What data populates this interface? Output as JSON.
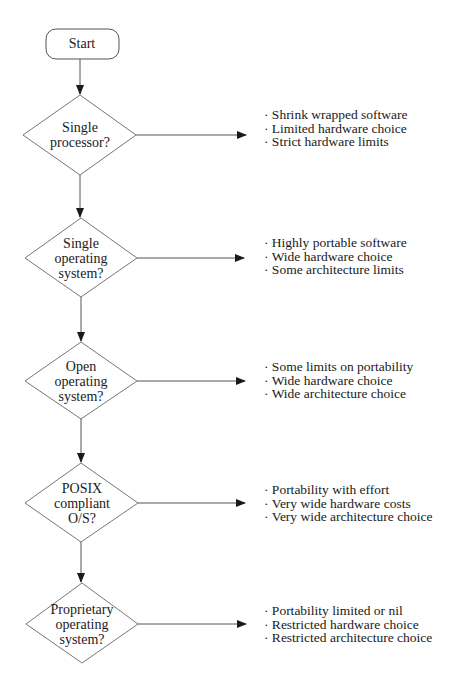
{
  "diagram": {
    "type": "flowchart",
    "colors": {
      "stroke": "#555555",
      "arrow": "#1a1a1a",
      "text": "#1a1a1a",
      "background": "#ffffff"
    },
    "top_fragment": "",
    "start": {
      "label": "Start"
    },
    "decisions": [
      {
        "lines": [
          "Single",
          "processor?"
        ],
        "outcomes": [
          "· Shrink wrapped software",
          "· Limited hardware choice",
          "· Strict hardware limits"
        ]
      },
      {
        "lines": [
          "Single",
          "operating",
          "system?"
        ],
        "outcomes": [
          "· Highly portable software",
          "· Wide hardware choice",
          "· Some architecture limits"
        ]
      },
      {
        "lines": [
          "Open",
          "operating",
          "system?"
        ],
        "outcomes": [
          "· Some limits on portability",
          "· Wide hardware choice",
          "· Wide architecture choice"
        ]
      },
      {
        "lines": [
          "POSIX",
          "compliant",
          "O/S?"
        ],
        "outcomes": [
          "· Portability with effort",
          "· Very wide hardware costs",
          "· Very wide architecture choice"
        ]
      },
      {
        "lines": [
          "Proprietary",
          "operating",
          "system?"
        ],
        "outcomes": [
          "· Portability limited or nil",
          "· Restricted hardware choice",
          "· Restricted architecture choice"
        ]
      }
    ]
  }
}
